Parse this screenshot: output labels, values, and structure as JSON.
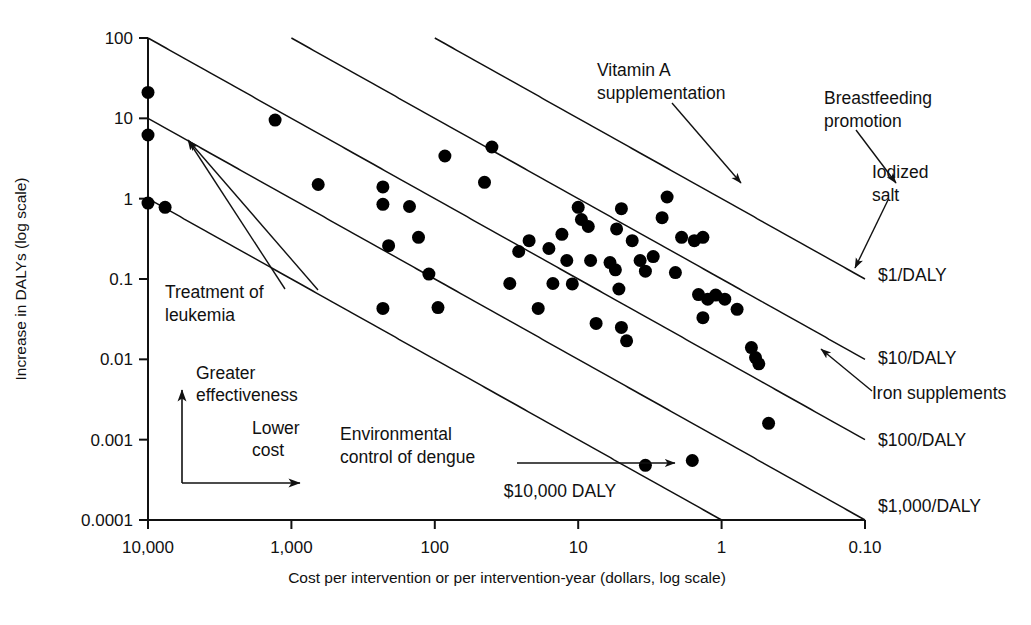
{
  "chart_data": {
    "type": "scatter",
    "title": "",
    "xlabel": "Cost per intervention or per intervention-year (dollars, log scale)",
    "ylabel": "Increase in DALYs (log scale)",
    "xscale": "log",
    "yscale": "log",
    "x_reversed": true,
    "xlim": [
      10000,
      0.1
    ],
    "ylim": [
      0.0001,
      100
    ],
    "grid": false,
    "legend": "none",
    "xticks": [
      {
        "value": 10000,
        "label": "10,000"
      },
      {
        "value": 1000,
        "label": "1,000"
      },
      {
        "value": 100,
        "label": "100"
      },
      {
        "value": 10,
        "label": "10"
      },
      {
        "value": 1,
        "label": "1"
      },
      {
        "value": 0.1,
        "label": "0.10"
      }
    ],
    "yticks": [
      {
        "value": 100,
        "label": "100"
      },
      {
        "value": 10,
        "label": "10"
      },
      {
        "value": 1,
        "label": "1"
      },
      {
        "value": 0.1,
        "label": "0.1"
      },
      {
        "value": 0.01,
        "label": "0.01"
      },
      {
        "value": 0.001,
        "label": "0.001"
      },
      {
        "value": 0.0001,
        "label": "0.0001"
      }
    ],
    "marker": {
      "shape": "circle",
      "color": "#000000",
      "size": 13
    },
    "points": [
      {
        "x": 10000,
        "y": 21
      },
      {
        "x": 10000,
        "y": 6.2
      },
      {
        "x": 10000,
        "y": 0.88
      },
      {
        "x": 7600,
        "y": 0.78
      },
      {
        "x": 1300,
        "y": 9.5
      },
      {
        "x": 650,
        "y": 1.5
      },
      {
        "x": 230,
        "y": 1.4
      },
      {
        "x": 230,
        "y": 0.85
      },
      {
        "x": 150,
        "y": 0.8
      },
      {
        "x": 210,
        "y": 0.26
      },
      {
        "x": 130,
        "y": 0.33
      },
      {
        "x": 230,
        "y": 0.043
      },
      {
        "x": 110,
        "y": 0.115
      },
      {
        "x": 95,
        "y": 0.044
      },
      {
        "x": 85,
        "y": 3.4
      },
      {
        "x": 40,
        "y": 4.4
      },
      {
        "x": 45,
        "y": 1.6
      },
      {
        "x": 16,
        "y": 0.24
      },
      {
        "x": 15,
        "y": 0.088
      },
      {
        "x": 13,
        "y": 0.36
      },
      {
        "x": 12,
        "y": 0.17
      },
      {
        "x": 11,
        "y": 0.087
      },
      {
        "x": 10,
        "y": 0.78
      },
      {
        "x": 9.5,
        "y": 0.55
      },
      {
        "x": 8.5,
        "y": 0.45
      },
      {
        "x": 8.2,
        "y": 0.17
      },
      {
        "x": 7.5,
        "y": 0.028
      },
      {
        "x": 6.0,
        "y": 0.16
      },
      {
        "x": 5.5,
        "y": 0.13
      },
      {
        "x": 5.2,
        "y": 0.075
      },
      {
        "x": 5.0,
        "y": 0.025
      },
      {
        "x": 4.6,
        "y": 0.017
      },
      {
        "x": 5.4,
        "y": 0.42
      },
      {
        "x": 5.0,
        "y": 0.75
      },
      {
        "x": 4.2,
        "y": 0.3
      },
      {
        "x": 3.7,
        "y": 0.17
      },
      {
        "x": 3.4,
        "y": 0.125
      },
      {
        "x": 3.0,
        "y": 0.19
      },
      {
        "x": 2.6,
        "y": 0.58
      },
      {
        "x": 2.4,
        "y": 1.05
      },
      {
        "x": 1.9,
        "y": 0.33
      },
      {
        "x": 1.55,
        "y": 0.3
      },
      {
        "x": 1.35,
        "y": 0.33
      },
      {
        "x": 1.45,
        "y": 0.064
      },
      {
        "x": 1.25,
        "y": 0.056
      },
      {
        "x": 1.1,
        "y": 0.063
      },
      {
        "x": 1.35,
        "y": 0.033
      },
      {
        "x": 0.62,
        "y": 0.014
      },
      {
        "x": 0.58,
        "y": 0.0105
      },
      {
        "x": 0.55,
        "y": 0.0088
      },
      {
        "x": 0.47,
        "y": 0.0016
      },
      {
        "x": 1.6,
        "y": 0.00055
      },
      {
        "x": 3.4,
        "y": 0.00048
      },
      {
        "x": 19,
        "y": 0.043
      },
      {
        "x": 30,
        "y": 0.088
      },
      {
        "x": 22,
        "y": 0.3
      },
      {
        "x": 26,
        "y": 0.22
      },
      {
        "x": 2.1,
        "y": 0.12
      },
      {
        "x": 0.95,
        "y": 0.056
      },
      {
        "x": 0.78,
        "y": 0.042
      }
    ],
    "reference_lines": [
      {
        "label": "$1/DALY",
        "ratio": 1
      },
      {
        "label": "$10/DALY",
        "ratio": 10
      },
      {
        "label": "$100/DALY",
        "ratio": 100
      },
      {
        "label": "$1,000/DALY",
        "ratio": 1000
      },
      {
        "label": "$10,000 DALY",
        "ratio": 10000
      }
    ],
    "annotations": [
      {
        "name": "vitamin-a",
        "text_lines": [
          "Vitamin A",
          "supplementation"
        ]
      },
      {
        "name": "breastfeeding",
        "text_lines": [
          "Breastfeeding",
          "promotion"
        ]
      },
      {
        "name": "iodized-salt",
        "text_lines": [
          "Iodized",
          "salt"
        ]
      },
      {
        "name": "treatment-leukemia",
        "text_lines": [
          "Treatment of",
          "leukemia"
        ]
      },
      {
        "name": "iron-supplements",
        "text_lines": [
          "Iron supplements"
        ]
      },
      {
        "name": "env-control-dengue",
        "text_lines": [
          "Environmental",
          "control of dengue"
        ]
      }
    ],
    "direction_guides": [
      {
        "name": "greater-effectiveness",
        "text_lines": [
          "Greater",
          "effectiveness"
        ],
        "direction": "up"
      },
      {
        "name": "lower-cost",
        "text_lines": [
          "Lower",
          "cost"
        ],
        "direction": "right"
      }
    ]
  }
}
